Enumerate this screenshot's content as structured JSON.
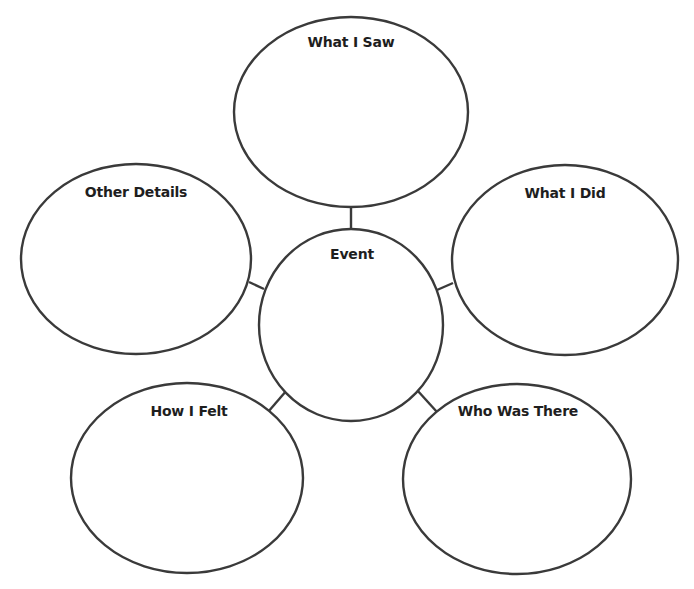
{
  "diagram": {
    "type": "bubble-map",
    "center": {
      "label": "Event"
    },
    "nodes": [
      {
        "id": "top",
        "label": "What I Saw"
      },
      {
        "id": "left",
        "label": "Other Details"
      },
      {
        "id": "right",
        "label": "What I Did"
      },
      {
        "id": "bottom-left",
        "label": "How I Felt"
      },
      {
        "id": "bottom-right",
        "label": "Who Was There"
      }
    ],
    "colors": {
      "stroke": "#3a3a3a",
      "text": "#1e1e1e",
      "background": "#ffffff"
    }
  }
}
